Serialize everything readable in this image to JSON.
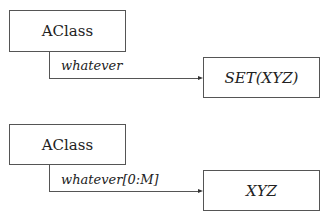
{
  "diagrams": [
    {
      "source": {
        "label": "AClass"
      },
      "relation": {
        "label": "whatever"
      },
      "target": {
        "label": "SET(XYZ)"
      }
    },
    {
      "source": {
        "label": "AClass"
      },
      "relation": {
        "label": "whatever[0:M]"
      },
      "target": {
        "label": "XYZ"
      }
    }
  ]
}
